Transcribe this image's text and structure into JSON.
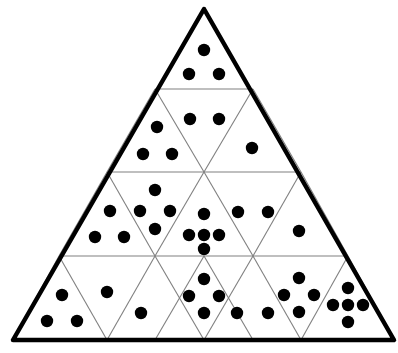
{
  "figure": {
    "name": "subdivided-triangle-dot-diagram",
    "background_color": "#ffffff",
    "outer_stroke_color": "#000000",
    "outer_stroke_width": 4.5,
    "inner_stroke_color": "#808080",
    "inner_stroke_width": 1.1,
    "dot_color": "#000000",
    "dot_radius": 6.2,
    "geometry": {
      "apex": [
        204,
        9
      ],
      "bottom_left": [
        13,
        340
      ],
      "bottom_right": [
        394,
        340
      ],
      "rows": 4,
      "row_divider_y": [
        89,
        172,
        256,
        340
      ]
    },
    "cells": [
      {
        "id": "r1-c1",
        "row": 1,
        "index": 1,
        "orientation": "up",
        "dot_count": 3,
        "dots": [
          [
            204,
            50
          ],
          [
            189,
            74
          ],
          [
            219,
            74
          ]
        ]
      },
      {
        "id": "r2-c1",
        "row": 2,
        "index": 1,
        "orientation": "up",
        "dot_count": 3,
        "dots": [
          [
            157,
            127
          ],
          [
            143,
            154
          ],
          [
            172,
            154
          ]
        ]
      },
      {
        "id": "r2-c2",
        "row": 2,
        "index": 2,
        "orientation": "down",
        "dot_count": 2,
        "dots": [
          [
            190,
            119
          ],
          [
            219,
            119
          ]
        ]
      },
      {
        "id": "r2-c3",
        "row": 2,
        "index": 3,
        "orientation": "up",
        "dot_count": 1,
        "dots": [
          [
            252,
            148
          ]
        ]
      },
      {
        "id": "r3-c1",
        "row": 3,
        "index": 1,
        "orientation": "up",
        "dot_count": 3,
        "dots": [
          [
            110,
            211
          ],
          [
            95,
            237
          ],
          [
            124,
            237
          ]
        ]
      },
      {
        "id": "r3-c2",
        "row": 3,
        "index": 2,
        "orientation": "down",
        "dot_count": 4,
        "dots": [
          [
            155,
            190
          ],
          [
            140,
            211
          ],
          [
            170,
            211
          ],
          [
            155,
            229
          ]
        ]
      },
      {
        "id": "r3-c3",
        "row": 3,
        "index": 3,
        "orientation": "up",
        "dot_count": 5,
        "dots": [
          [
            204,
            214
          ],
          [
            189,
            235
          ],
          [
            204,
            235
          ],
          [
            219,
            235
          ],
          [
            204,
            249
          ]
        ]
      },
      {
        "id": "r3-c4",
        "row": 3,
        "index": 4,
        "orientation": "down",
        "dot_count": 2,
        "dots": [
          [
            238,
            212
          ],
          [
            268,
            212
          ]
        ]
      },
      {
        "id": "r3-c5",
        "row": 3,
        "index": 5,
        "orientation": "up",
        "dot_count": 1,
        "dots": [
          [
            299,
            231
          ]
        ]
      },
      {
        "id": "r4-c1",
        "row": 4,
        "index": 1,
        "orientation": "up",
        "dot_count": 3,
        "dots": [
          [
            62,
            295
          ],
          [
            47,
            321
          ],
          [
            77,
            321
          ]
        ]
      },
      {
        "id": "r4-c2",
        "row": 4,
        "index": 2,
        "orientation": "down",
        "dot_count": 2,
        "dots": [
          [
            107,
            292
          ],
          [
            141,
            313
          ]
        ]
      },
      {
        "id": "r4-c3",
        "row": 4,
        "index": 3,
        "orientation": "up",
        "dot_count": 4,
        "dots": [
          [
            204,
            279
          ],
          [
            189,
            296
          ],
          [
            219,
            296
          ],
          [
            204,
            313
          ]
        ]
      },
      {
        "id": "r4-c4",
        "row": 4,
        "index": 4,
        "orientation": "down",
        "dot_count": 2,
        "dots": [
          [
            237,
            313
          ],
          [
            268,
            313
          ]
        ]
      },
      {
        "id": "r4-c5",
        "row": 4,
        "index": 5,
        "orientation": "up",
        "dot_count": 4,
        "dots": [
          [
            299,
            278
          ],
          [
            284,
            295
          ],
          [
            314,
            295
          ],
          [
            299,
            312
          ]
        ]
      },
      {
        "id": "r4-c6",
        "row": 4,
        "index": 6,
        "orientation": "down",
        "dot_count": 5,
        "dots": [
          [
            348,
            288
          ],
          [
            333,
            305
          ],
          [
            348,
            305
          ],
          [
            363,
            305
          ],
          [
            348,
            322
          ]
        ]
      }
    ],
    "inner_lines": [
      {
        "name": "row-divider-1",
        "x1": 155,
        "y1": 89,
        "x2": 253,
        "y2": 89
      },
      {
        "name": "row-divider-2",
        "x1": 107,
        "y1": 172,
        "x2": 301,
        "y2": 172
      },
      {
        "name": "row-divider-3",
        "x1": 59,
        "y1": 256,
        "x2": 348,
        "y2": 256
      },
      {
        "name": "left-diag-1",
        "x1": 155,
        "y1": 89,
        "x2": 107,
        "y2": 172
      },
      {
        "name": "left-diag-2",
        "x1": 107,
        "y1": 172,
        "x2": 59,
        "y2": 256
      },
      {
        "name": "left-diag-3",
        "x1": 59,
        "y1": 256,
        "x2": 13,
        "y2": 340
      },
      {
        "name": "left-diag-4",
        "x1": 204,
        "y1": 172,
        "x2": 155,
        "y2": 256
      },
      {
        "name": "left-diag-5",
        "x1": 155,
        "y1": 256,
        "x2": 107,
        "y2": 340
      },
      {
        "name": "left-diag-6",
        "x1": 253,
        "y1": 256,
        "x2": 204,
        "y2": 340
      },
      {
        "name": "right-diag-1",
        "x1": 253,
        "y1": 89,
        "x2": 301,
        "y2": 172
      },
      {
        "name": "right-diag-2",
        "x1": 301,
        "y1": 172,
        "x2": 348,
        "y2": 256
      },
      {
        "name": "right-diag-3",
        "x1": 348,
        "y1": 256,
        "x2": 394,
        "y2": 340
      },
      {
        "name": "right-diag-4",
        "x1": 204,
        "y1": 172,
        "x2": 253,
        "y2": 256
      },
      {
        "name": "right-diag-5",
        "x1": 253,
        "y1": 256,
        "x2": 301,
        "y2": 340
      },
      {
        "name": "right-diag-6",
        "x1": 155,
        "y1": 256,
        "x2": 204,
        "y2": 340
      },
      {
        "name": "mid-diag-left-up",
        "x1": 155,
        "y1": 89,
        "x2": 204,
        "y2": 172
      },
      {
        "name": "mid-diag-right-up",
        "x1": 253,
        "y1": 89,
        "x2": 204,
        "y2": 172
      },
      {
        "name": "inner-left-up-2",
        "x1": 107,
        "y1": 172,
        "x2": 155,
        "y2": 256
      },
      {
        "name": "inner-right-up-2",
        "x1": 301,
        "y1": 172,
        "x2": 253,
        "y2": 256
      },
      {
        "name": "inner-left-up-3",
        "x1": 59,
        "y1": 256,
        "x2": 107,
        "y2": 340
      },
      {
        "name": "inner-mid-up-3",
        "x1": 204,
        "y1": 256,
        "x2": 155,
        "y2": 340
      },
      {
        "name": "inner-mid-up-3b",
        "x1": 204,
        "y1": 256,
        "x2": 253,
        "y2": 340
      },
      {
        "name": "inner-right-up-3",
        "x1": 348,
        "y1": 256,
        "x2": 301,
        "y2": 340
      }
    ],
    "total_dot_count": 44
  }
}
